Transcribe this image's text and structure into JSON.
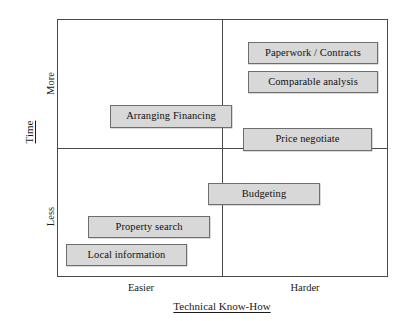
{
  "diagram": {
    "type": "2x2-quadrant-matrix",
    "title": "",
    "axes": {
      "y": {
        "title": "Time",
        "ticks": [
          "More",
          "Less"
        ],
        "orientation": "vertical",
        "underlined": true
      },
      "x": {
        "title": "Technical Know-How",
        "ticks": [
          "Easier",
          "Harder"
        ],
        "orientation": "horizontal",
        "underlined": true
      }
    },
    "colors": {
      "box_fill": "#d8d8d8",
      "box_border": "#6e6e6e",
      "frame_border": "#4a4a4a",
      "background": "#ffffff",
      "text": "#111111"
    },
    "items": [
      {
        "label": "Paperwork / Contracts",
        "quadrant": "more-time-harder",
        "left": 248,
        "top": 42,
        "width": 130,
        "height": 22
      },
      {
        "label": "Comparable analysis",
        "quadrant": "more-time-harder",
        "left": 248,
        "top": 71,
        "width": 130,
        "height": 22
      },
      {
        "label": "Arranging Financing",
        "quadrant": "more-time-easier",
        "left": 110,
        "top": 105,
        "width": 122,
        "height": 23
      },
      {
        "label": "Price negotiate",
        "quadrant": "more-time-harder",
        "left": 243,
        "top": 128,
        "width": 129,
        "height": 23
      },
      {
        "label": "Budgeting",
        "quadrant": "less-time-spanning",
        "left": 208,
        "top": 183,
        "width": 112,
        "height": 22
      },
      {
        "label": "Property search",
        "quadrant": "less-time-easier",
        "left": 88,
        "top": 216,
        "width": 122,
        "height": 22
      },
      {
        "label": "Local information",
        "quadrant": "less-time-easier",
        "left": 66,
        "top": 244,
        "width": 121,
        "height": 22
      }
    ]
  }
}
